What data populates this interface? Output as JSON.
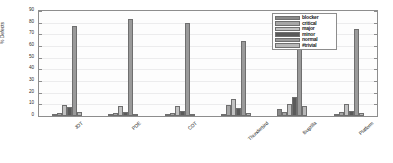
{
  "chart_data": {
    "type": "bar",
    "title": "",
    "xlabel": "",
    "ylabel": "% Defects",
    "ylim": [
      0,
      90
    ],
    "yticks": [
      0,
      10,
      20,
      30,
      40,
      50,
      60,
      70,
      80,
      90
    ],
    "grid": true,
    "legend_position": "top-right",
    "categories": [
      "JDT",
      "PDE",
      "CDT",
      "Thunderbird",
      "Bugzilla",
      "Platform"
    ],
    "series": [
      {
        "name": "blocker",
        "color": "#8a8a8a",
        "values": [
          1,
          1,
          1.5,
          0.8,
          6,
          1.5
        ]
      },
      {
        "name": "critical",
        "color": "#a6a6a6",
        "values": [
          3,
          2.5,
          3,
          9.5,
          3.5,
          3.5
        ]
      },
      {
        "name": "major",
        "color": "#c2c2c2",
        "values": [
          9.5,
          8.5,
          8.5,
          15,
          10.5,
          10
        ]
      },
      {
        "name": "minor",
        "color": "#5a5a5a",
        "values": [
          7.5,
          3.5,
          4.5,
          7,
          16,
          4
        ]
      },
      {
        "name": "normal",
        "color": "#9a9a9a",
        "values": [
          77,
          83,
          80,
          64,
          63,
          75
        ]
      },
      {
        "name": "trivial",
        "color": "#b8b8b8",
        "values": [
          3.5,
          2,
          1.5,
          2.2,
          8.5,
          2.5
        ]
      }
    ]
  },
  "legend": {
    "entries": [
      "blocker",
      "critical",
      "major",
      "minor",
      "normal",
      "#trivial"
    ]
  }
}
